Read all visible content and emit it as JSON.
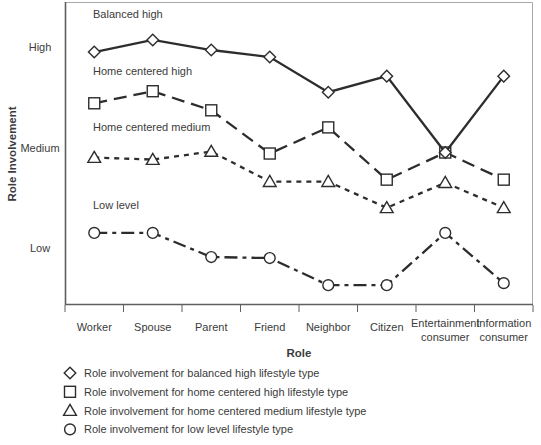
{
  "colors": {
    "line": "#2d2d2d",
    "marker_stroke": "#2d2d2d",
    "marker_fill": "#ffffff",
    "text": "#3b3b3b",
    "axis": "#5f5f5f",
    "box_light": "#a8a8a8",
    "background": "#ffffff"
  },
  "chart_data": {
    "type": "line",
    "title": "",
    "xlabel": "Role",
    "ylabel": "Role Involvement",
    "categories": [
      "Worker",
      "Spouse",
      "Parent",
      "Friend",
      "Neighbor",
      "Citizen",
      "Entertainment consumer",
      "Information consumer"
    ],
    "category_label_lines": [
      [
        "Worker"
      ],
      [
        "Spouse"
      ],
      [
        "Parent"
      ],
      [
        "Friend"
      ],
      [
        "Neighbor"
      ],
      [
        "Citizen"
      ],
      [
        "Entertainment",
        "consumer"
      ],
      [
        "Information",
        "consumer"
      ]
    ],
    "y_axis": {
      "scale_note": "qualitative scale mapped Low=1, Medium=2, High=3",
      "ticks": [
        {
          "label": "High",
          "value": 3
        },
        {
          "label": "Medium",
          "value": 2
        },
        {
          "label": "Low",
          "value": 1
        }
      ],
      "range": [
        0.3,
        3.45
      ],
      "gridlines": false
    },
    "series": [
      {
        "name": "Balanced high",
        "legend_label": "Role involvement for balanced high lifestyle type",
        "marker": "diamond",
        "line_style": "solid",
        "values": [
          2.95,
          3.07,
          2.97,
          2.9,
          2.55,
          2.71,
          1.95,
          2.71
        ]
      },
      {
        "name": "Home centered high",
        "legend_label": "Role involvement for home centered high lifestyle type",
        "marker": "square",
        "line_style": "long-dash",
        "values": [
          2.44,
          2.56,
          2.37,
          1.94,
          2.2,
          1.68,
          1.95,
          1.68
        ]
      },
      {
        "name": "Home centered medium",
        "legend_label": "Role involvement for home centered medium lifestyle type",
        "marker": "triangle",
        "line_style": "short-dash",
        "values": [
          1.9,
          1.88,
          1.96,
          1.66,
          1.66,
          1.4,
          1.65,
          1.4
        ]
      },
      {
        "name": "Low level",
        "legend_label": "Role involvement for low level lifestyle type",
        "marker": "circle",
        "line_style": "dash-dot",
        "values": [
          1.15,
          1.15,
          0.91,
          0.9,
          0.63,
          0.63,
          1.15,
          0.65
        ]
      }
    ],
    "annotations": [
      {
        "text": "Balanced high",
        "value": 3.33
      },
      {
        "text": "Home centered high",
        "value": 2.76
      },
      {
        "text": "Home centered medium",
        "value": 2.2
      },
      {
        "text": "Low level",
        "value": 1.43
      }
    ],
    "legend_position": "below"
  }
}
